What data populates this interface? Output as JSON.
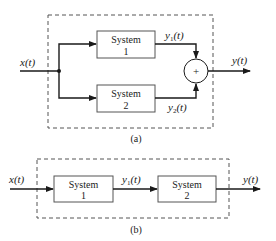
{
  "diagram_a": {
    "caption": "(a)",
    "input_label": "x(t)",
    "output_label": "y(t)",
    "system1": {
      "line1": "System",
      "line2": "1"
    },
    "system2": {
      "line1": "System",
      "line2": "2"
    },
    "y1_label": "y",
    "y1_sub": "1",
    "y2_label": "y",
    "y2_sub": "2",
    "t_suffix": "(t)",
    "sum_symbol": "+"
  },
  "diagram_b": {
    "caption": "(b)",
    "input_label": "x(t)",
    "output_label": "y(t)",
    "system1": {
      "line1": "System",
      "line2": "1"
    },
    "system2": {
      "line1": "System",
      "line2": "2"
    },
    "y1_label": "y",
    "y1_sub": "1",
    "t_suffix": "(t)"
  },
  "colors": {
    "ink": "#1a1a1a",
    "box_border": "#555555",
    "background": "#ffffff"
  }
}
